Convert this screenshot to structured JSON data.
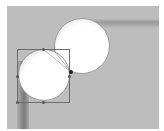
{
  "canvas": {
    "background": "#bdbdbd",
    "objects": [
      {
        "type": "circle",
        "name": "top-right-circle",
        "fill": "#ffffff"
      },
      {
        "type": "circle",
        "name": "bottom-left-circle",
        "fill": "#ffffff",
        "selected": true
      },
      {
        "type": "bar",
        "name": "horizontal-bar",
        "orientation": "horizontal"
      },
      {
        "type": "bar",
        "name": "vertical-bar",
        "orientation": "vertical"
      }
    ],
    "selection": {
      "handles": [
        "top-middle",
        "left-middle",
        "right-middle",
        "bottom-middle"
      ],
      "anchor": "right"
    }
  }
}
